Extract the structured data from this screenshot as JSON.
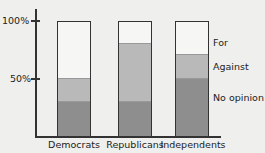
{
  "chart_data": {
    "type": "bar",
    "stacked": true,
    "title": "",
    "xlabel": "",
    "ylabel": "",
    "ylim": [
      0,
      100
    ],
    "yticks": [
      "50%",
      "100%"
    ],
    "categories": [
      "Democrats",
      "Republicans",
      "Independents"
    ],
    "series": [
      {
        "name": "No opinion",
        "values": [
          30,
          30,
          50
        ],
        "color": "#8e8e8e"
      },
      {
        "name": "Against",
        "values": [
          20,
          51,
          21
        ],
        "color": "#b9b9b9"
      },
      {
        "name": "For",
        "values": [
          50,
          19,
          29
        ],
        "color": "#f6f6f4"
      }
    ],
    "legend_position": "right",
    "grid": false
  },
  "axis": {
    "tick_100": "100%",
    "tick_50": "50%"
  },
  "legend": {
    "for": "For",
    "against": "Against",
    "no_opinion": "No opinion"
  },
  "categories": {
    "democrats": "Democrats",
    "republicans": "Republicans",
    "independents": "Independents"
  }
}
